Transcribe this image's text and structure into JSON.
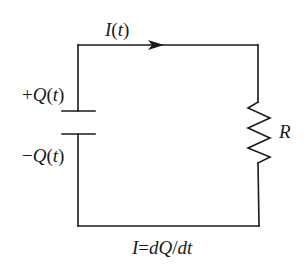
{
  "diagram": {
    "type": "RC circuit (capacitor discharging through resistor)",
    "colors": {
      "background": "#ffffff",
      "stroke": "#1a1a1a"
    },
    "labels": {
      "current_name": "I",
      "current_paren_open": "(",
      "current_var": "t",
      "current_paren_close": ")",
      "plus_sign": "+",
      "plus_q_name": "Q",
      "plus_q_paren_open": "(",
      "plus_q_var": "t",
      "plus_q_paren_close": ")",
      "minus_sign": "−",
      "minus_q_name": "Q",
      "minus_q_paren_open": "(",
      "minus_q_var": "t",
      "minus_q_paren_close": ")",
      "resistor": "R",
      "equation_lhs": "I",
      "equation_eq": "=",
      "equation_rhs": "dQ",
      "equation_slash": "/",
      "equation_denom": "dt"
    },
    "components": [
      {
        "kind": "capacitor",
        "position": "left branch",
        "top_plate_charge": "+Q(t)",
        "bottom_plate_charge": "-Q(t)"
      },
      {
        "kind": "resistor",
        "position": "right branch",
        "label": "R"
      },
      {
        "kind": "current-arrow",
        "position": "top wire",
        "direction": "right",
        "label": "I(t)"
      }
    ],
    "caption": "I=dQ/dt"
  }
}
